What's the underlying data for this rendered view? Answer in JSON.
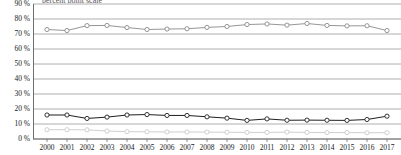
{
  "chart": {
    "title_fragment": "percent point scale",
    "axis_unit_suffix": " %"
  },
  "chart_data": {
    "type": "line",
    "title": "",
    "xlabel": "",
    "ylabel": "",
    "ylim": [
      0,
      90
    ],
    "ytick_step": 10,
    "grid": true,
    "legend": "none",
    "ytick_labels": [
      "90 %",
      "80 %",
      "70 %",
      "60 %",
      "50 %",
      "40 %",
      "30 %",
      "20 %",
      "10 %",
      "0 %"
    ],
    "ytick_values": [
      90,
      80,
      70,
      60,
      50,
      40,
      30,
      20,
      10,
      0
    ],
    "categories": [
      "2000",
      "2001",
      "2002",
      "2003",
      "2004",
      "2005",
      "2006",
      "2007",
      "2008",
      "2009",
      "2010",
      "2011",
      "2012",
      "2013",
      "2014",
      "2015",
      "2016",
      "2017"
    ],
    "x": [
      2000,
      2001,
      2002,
      2003,
      2004,
      2005,
      2006,
      2007,
      2008,
      2009,
      2010,
      2011,
      2012,
      2013,
      2014,
      2015,
      2016,
      2017
    ],
    "series": [
      {
        "name": "series-upper",
        "color": "#8a8a8a",
        "marker": "circle-open",
        "values": [
          73.0,
          72.3,
          75.6,
          75.7,
          74.3,
          73.0,
          73.3,
          73.5,
          74.4,
          75.0,
          76.3,
          76.7,
          75.9,
          77.0,
          75.7,
          75.4,
          75.5,
          72.3
        ]
      },
      {
        "name": "series-middle",
        "color": "#1f1f1f",
        "marker": "circle-open",
        "values": [
          16.0,
          16.0,
          13.7,
          14.6,
          16.0,
          16.3,
          15.7,
          15.7,
          14.8,
          13.9,
          12.4,
          13.4,
          12.5,
          12.6,
          12.5,
          12.4,
          13.0,
          15.2
        ]
      },
      {
        "name": "series-lower",
        "color": "#c9c9c9",
        "marker": "circle-open",
        "values": [
          6.2,
          6.2,
          6.1,
          5.3,
          4.9,
          4.8,
          4.7,
          4.7,
          4.6,
          4.5,
          4.4,
          4.4,
          4.6,
          4.4,
          4.3,
          4.3,
          4.2,
          4.2
        ]
      }
    ]
  }
}
